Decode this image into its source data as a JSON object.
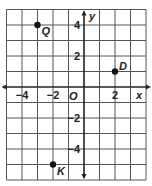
{
  "graph": {
    "origin_px": [
      84,
      87
    ],
    "unit_px": 15.5,
    "x_range": [
      -5,
      4
    ],
    "y_range": [
      -6,
      5
    ],
    "axis_labels": {
      "x": "x",
      "y": "y",
      "origin": "O"
    },
    "x_ticks": [
      {
        "value": -4,
        "label": "−4"
      },
      {
        "value": -2,
        "label": "−2"
      },
      {
        "value": 2,
        "label": "2"
      }
    ],
    "y_ticks": [
      {
        "value": 4,
        "label": "4"
      },
      {
        "value": 2,
        "label": "2"
      },
      {
        "value": -2,
        "label": "−2"
      },
      {
        "value": -4,
        "label": "−4"
      }
    ],
    "points": [
      {
        "name": "Q",
        "x": -3,
        "y": 4
      },
      {
        "name": "D",
        "x": 2,
        "y": 1
      },
      {
        "name": "K",
        "x": -2,
        "y": -5
      }
    ],
    "colors": {
      "grid": "#555555",
      "axis": "#222222",
      "point": "#111111"
    }
  }
}
